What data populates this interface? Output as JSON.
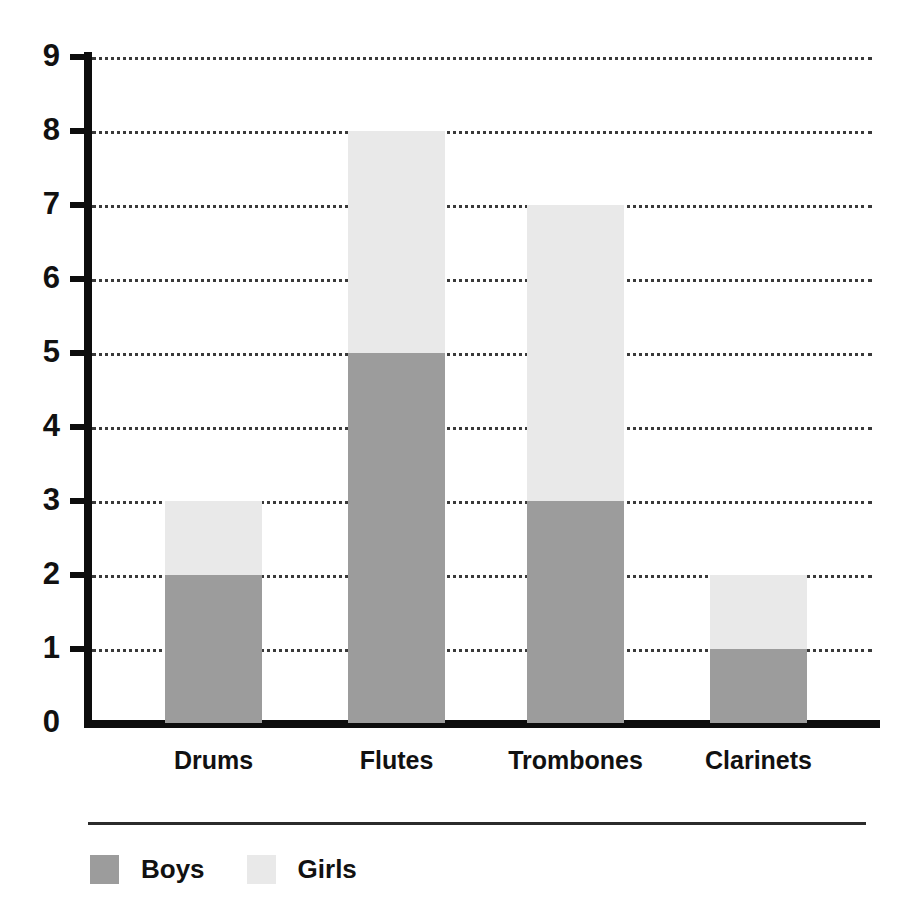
{
  "chart_data": {
    "type": "bar",
    "subtype": "stacked-bar",
    "title": "",
    "xlabel": "",
    "ylabel": "",
    "categories": [
      "Drums",
      "Flutes",
      "Trombones",
      "Clarinets"
    ],
    "series": [
      {
        "name": "Boys",
        "color": "#9c9c9c",
        "values": [
          2,
          5,
          3,
          1
        ]
      },
      {
        "name": "Girls",
        "color": "#e9e9e9",
        "values": [
          1,
          3,
          4,
          1
        ]
      }
    ],
    "totals": [
      3,
      8,
      7,
      2
    ],
    "ylim": [
      0,
      9
    ],
    "ytick_labels": [
      "0",
      "1",
      "2",
      "3",
      "4",
      "5",
      "6",
      "7",
      "8",
      "9"
    ],
    "ytick_values": [
      0,
      1,
      2,
      3,
      4,
      5,
      6,
      7,
      8,
      9
    ],
    "grid": "horizontal-dotted",
    "legend_position": "bottom-left",
    "legend_entries": [
      "Boys",
      "Girls"
    ]
  },
  "colors": {
    "boys": "#9c9c9c",
    "girls": "#e9e9e9",
    "axis": "#0d0d0d",
    "grid": "#3a3a3a",
    "text": "#111111",
    "background": "#ffffff"
  }
}
